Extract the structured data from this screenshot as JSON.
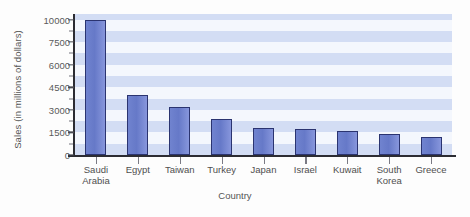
{
  "chart_data": {
    "type": "bar",
    "title": "",
    "xlabel": "Country",
    "ylabel": "Sales (in millions of dollars)",
    "categories": [
      "Saudi\nArabia",
      "Egypt",
      "Taiwan",
      "Turkey",
      "Japan",
      "Israel",
      "Kuwait",
      "South\nKorea",
      "Greece"
    ],
    "values": [
      10000,
      4000,
      3200,
      2400,
      1800,
      1700,
      1600,
      1400,
      1200
    ],
    "ytick_labels": [
      "0",
      "1500",
      "3000",
      "4500",
      "6000",
      "7500",
      "10000"
    ],
    "ytick_values": [
      0,
      1500,
      3000,
      4500,
      6000,
      7500,
      10000
    ],
    "ylim": [
      0,
      10000
    ],
    "grid": "horizontal-bands",
    "legend": "none",
    "bar_color": "#6a7fd0",
    "bar_edge_color": "#2b3470",
    "band_color": "#d3ddf4",
    "plot_bg": "#eef2fb"
  }
}
